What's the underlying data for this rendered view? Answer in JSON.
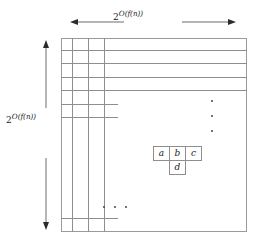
{
  "figure": {
    "name": "computation-tableau",
    "background_color": "#ffffff",
    "line_color": "#8e8e8e",
    "text_color": "#1a1a1a"
  },
  "labels": {
    "top": {
      "base": "2",
      "exponent_o": "O",
      "exponent_arg": "(f(n))",
      "full": "2^O(f(n))"
    },
    "left": {
      "base": "2",
      "exponent_o": "O",
      "exponent_arg": "(f(n))",
      "full": "2^O(f(n))"
    }
  },
  "arrows": {
    "top": {
      "name": "horizontal-dimension-arrow",
      "direction": "double-headed-horizontal"
    },
    "left": {
      "name": "vertical-dimension-arrow",
      "direction": "double-headed-vertical"
    }
  },
  "grid": {
    "vertical_lines_x": [
      11,
      27,
      43
    ],
    "horizontal_lines": [
      {
        "y": 12,
        "width": 186
      },
      {
        "y": 25,
        "width": 186
      },
      {
        "y": 39,
        "width": 186
      },
      {
        "y": 52,
        "width": 186
      },
      {
        "y": 66,
        "width": 57
      },
      {
        "y": 79,
        "width": 57
      },
      {
        "y": 180,
        "width": 57
      }
    ]
  },
  "ellipses": {
    "vertical": {
      "name": "vertical-ellipsis",
      "dots": 3
    },
    "horizontal": {
      "name": "horizontal-ellipsis",
      "dots": 3
    }
  },
  "cells": {
    "a": "a",
    "b": "b",
    "c": "c",
    "d": "d"
  }
}
